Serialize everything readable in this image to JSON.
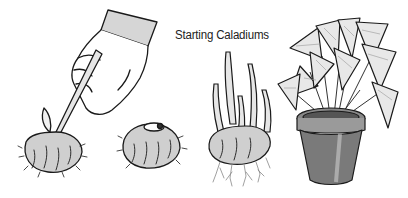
{
  "illustration": {
    "title": "Starting Caladiums",
    "panels": [
      {
        "id": "cut-tuber",
        "description": "hand with knife cutting caladium tuber"
      },
      {
        "id": "whole-tuber",
        "description": "caladium tuber with bud eye"
      },
      {
        "id": "sprouting-tuber",
        "description": "sprouting tuber with roots"
      },
      {
        "id": "potted-plant",
        "description": "mature caladium in clay pot"
      }
    ],
    "colors": {
      "line": "#1a1a1a",
      "shade": "#8a8a8a",
      "light": "#d9d9d9",
      "background": "#ffffff"
    }
  }
}
